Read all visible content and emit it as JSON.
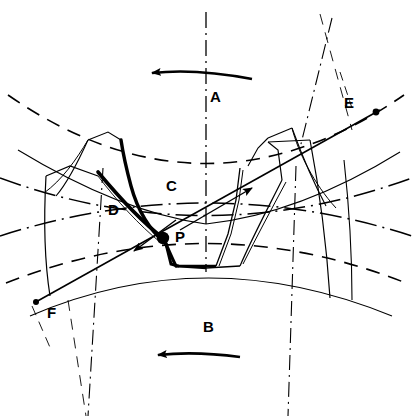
{
  "figure": {
    "background_color": "#ffffff",
    "line_color": "#000000",
    "width": 412,
    "height": 416
  },
  "labels": {
    "driver_gear": {
      "text": "A",
      "x": 214,
      "y": 97,
      "role": "upper-gear-label"
    },
    "driven_gear": {
      "text": "B",
      "x": 206,
      "y": 326,
      "role": "lower-gear-label"
    },
    "tooth_upper": {
      "text": "C",
      "x": 168,
      "y": 178,
      "role": "upper-tooth-label"
    },
    "tooth_lower": {
      "text": "D",
      "x": 110,
      "y": 206,
      "role": "lower-tooth-label"
    },
    "point_e": {
      "text": "E",
      "x": 345,
      "y": 100,
      "role": "line-of-action-end-upper"
    },
    "point_f": {
      "text": "F",
      "x": 48,
      "y": 312,
      "role": "line-of-action-end-lower"
    },
    "pitch_point": {
      "text": "P",
      "x": 175,
      "y": 235,
      "role": "pitch-point-label"
    }
  },
  "rotation_arrows": {
    "upper": {
      "name": "upper-rotation-arrow",
      "direction": "left",
      "y": 73
    },
    "lower": {
      "name": "lower-rotation-arrow",
      "direction": "left",
      "y": 355
    }
  },
  "line_of_action": {
    "name": "line-of-action",
    "from_point": "F",
    "to_point": "E",
    "through": "P",
    "from_x": 34,
    "from_y": 303,
    "to_x": 380,
    "to_y": 110,
    "arrow_upper_x": 250,
    "arrow_upper_y": 185,
    "arrow_lower_x": 138,
    "arrow_lower_y": 249
  },
  "pitch_point_marker": {
    "name": "pitch-point-dot",
    "x": 163,
    "y": 238,
    "r": 6
  },
  "geometry_notes": {
    "upper_gear_center_y": -360,
    "lower_gear_center_y": 760,
    "pressure_angle_deg": 29
  }
}
